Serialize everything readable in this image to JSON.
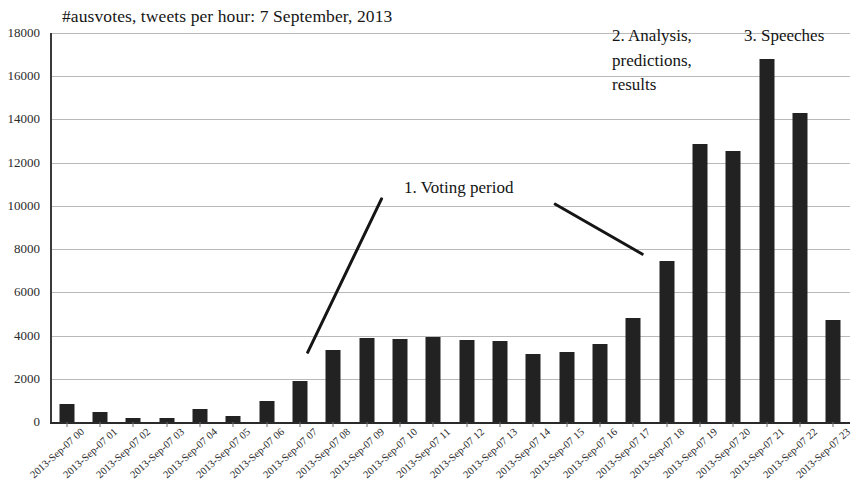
{
  "chart_data": {
    "type": "bar",
    "title": "#ausvotes, tweets per hour: 7 September, 2013",
    "xlabel": "",
    "ylabel": "",
    "ylim": [
      0,
      18000
    ],
    "yticks": [
      0,
      2000,
      4000,
      6000,
      8000,
      10000,
      12000,
      14000,
      16000,
      18000
    ],
    "grid": true,
    "legend": "none",
    "bar_color": "#222222",
    "categories": [
      "2013-Sep-07 00",
      "2013-Sep-07 01",
      "2013-Sep-07 02",
      "2013-Sep-07 03",
      "2013-Sep-07 04",
      "2013-Sep-07 05",
      "2013-Sep-07 06",
      "2013-Sep-07 07",
      "2013-Sep-07 08",
      "2013-Sep-07 09",
      "2013-Sep-07 10",
      "2013-Sep-07 11",
      "2013-Sep-07 12",
      "2013-Sep-07 13",
      "2013-Sep-07 14",
      "2013-Sep-07 15",
      "2013-Sep-07 16",
      "2013-Sep-07 17",
      "2013-Sep-07 18",
      "2013-Sep-07 19",
      "2013-Sep-07 20",
      "2013-Sep-07 21",
      "2013-Sep-07 22",
      "2013-Sep-07 23"
    ],
    "values": [
      850,
      450,
      200,
      180,
      600,
      300,
      950,
      1900,
      3350,
      3900,
      3850,
      3950,
      3800,
      3750,
      3150,
      3250,
      3600,
      4800,
      7450,
      12850,
      12550,
      16800,
      14300,
      4700
    ],
    "annotations": [
      {
        "id": "voting",
        "text": "1. Voting period"
      },
      {
        "id": "analysis",
        "text": "2. Analysis,\npredictions,\nresults"
      },
      {
        "id": "speeches",
        "text": "3. Speeches"
      }
    ]
  }
}
